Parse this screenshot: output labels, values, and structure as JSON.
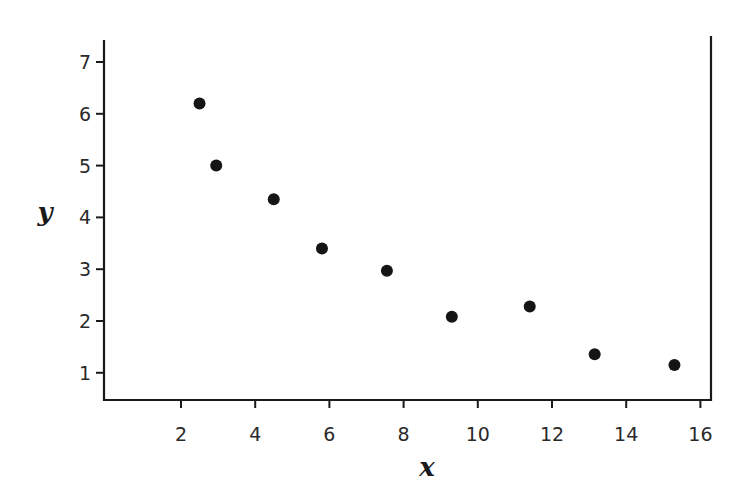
{
  "chart_data": {
    "type": "scatter",
    "title": "",
    "xlabel": "x",
    "ylabel": "y",
    "xlim": [
      -0.2,
      16.4
    ],
    "ylim": [
      0.5,
      7.45
    ],
    "xticks": [
      2,
      4,
      6,
      8,
      10,
      12,
      14,
      16
    ],
    "yticks": [
      1,
      2,
      3,
      4,
      5,
      6,
      7
    ],
    "grid": false,
    "legend": null,
    "marker_color": "#151515",
    "series": [
      {
        "name": "data",
        "points": [
          {
            "x": 2.5,
            "y": 6.2
          },
          {
            "x": 2.95,
            "y": 5.0
          },
          {
            "x": 4.5,
            "y": 4.35
          },
          {
            "x": 5.8,
            "y": 3.4
          },
          {
            "x": 7.55,
            "y": 2.97
          },
          {
            "x": 9.3,
            "y": 2.08
          },
          {
            "x": 11.4,
            "y": 2.28
          },
          {
            "x": 13.15,
            "y": 1.36
          },
          {
            "x": 15.3,
            "y": 1.15
          }
        ]
      }
    ]
  }
}
